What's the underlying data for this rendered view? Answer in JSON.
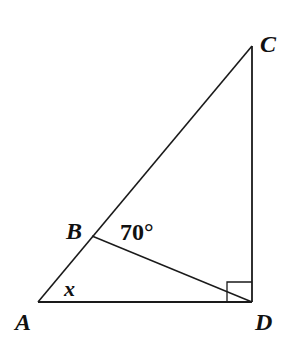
{
  "figure": {
    "type": "geometry",
    "line_color": "#1a1a1a",
    "points": {
      "A": {
        "label": "A",
        "x": 38,
        "y": 302
      },
      "B": {
        "label": "B",
        "x": 92,
        "y": 236
      },
      "C": {
        "label": "C",
        "x": 252,
        "y": 46
      },
      "D": {
        "label": "D",
        "x": 252,
        "y": 302
      }
    },
    "segments": [
      "AC",
      "AD",
      "CD",
      "BD"
    ],
    "right_angle_at": "D",
    "angle_labels": {
      "x": "x",
      "given": "70°"
    }
  }
}
